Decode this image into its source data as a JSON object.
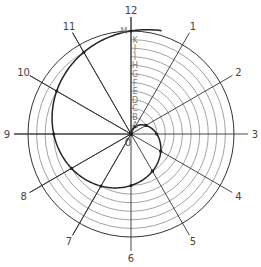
{
  "diagram": {
    "center_label": "0",
    "radial_labels": [
      "1",
      "2",
      "3",
      "4",
      "5",
      "6",
      "7",
      "8",
      "9",
      "10",
      "11",
      "12"
    ],
    "step_letters": [
      "A",
      "B",
      "C",
      "D",
      "E",
      "F",
      "G",
      "H",
      "I",
      "J",
      "K",
      "M"
    ],
    "colors": {
      "line": "#333333",
      "arc": "#999999",
      "spiral": "#222222",
      "text": "#444444",
      "letters": "#777777"
    }
  }
}
